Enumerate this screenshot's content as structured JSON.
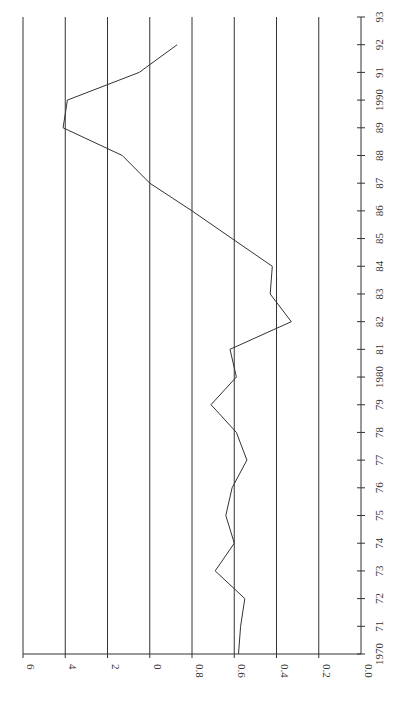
{
  "chart_data": {
    "type": "line",
    "orientation": "rotated-90",
    "title": "",
    "xlabel": "",
    "ylabel": "",
    "x_tick_labels": [
      "1970",
      "71",
      "72",
      "73",
      "74",
      "75",
      "76",
      "77",
      "78",
      "79",
      "1980",
      "81",
      "82",
      "83",
      "84",
      "85",
      "86",
      "87",
      "88",
      "89",
      "1990",
      "91",
      "92",
      "93"
    ],
    "y_tick_labels": [
      "0.0",
      "0.2",
      "0.4",
      "0.6",
      "0.8",
      "0",
      "2",
      "4",
      "6"
    ],
    "y_tick_values": [
      0.0,
      0.2,
      0.4,
      0.6,
      0.8,
      1.0,
      1.2,
      1.4,
      1.6
    ],
    "ylim": [
      0.0,
      1.6
    ],
    "xlim": [
      1970,
      1993
    ],
    "grid": true,
    "series": [
      {
        "name": "series",
        "x": [
          1970,
          1971,
          1972,
          1973,
          1974,
          1975,
          1976,
          1977,
          1978,
          1979,
          1980,
          1981,
          1982,
          1983,
          1984,
          1985,
          1986,
          1987,
          1988,
          1989,
          1990,
          1991,
          1992
        ],
        "values": [
          0.58,
          0.57,
          0.55,
          0.69,
          0.6,
          0.64,
          0.61,
          0.54,
          0.59,
          0.71,
          0.59,
          0.62,
          0.33,
          0.43,
          0.42,
          0.61,
          0.8,
          1.0,
          1.13,
          1.41,
          1.39,
          1.05,
          0.87
        ]
      }
    ],
    "line_color": "#333333",
    "grid_color": "#333333"
  }
}
